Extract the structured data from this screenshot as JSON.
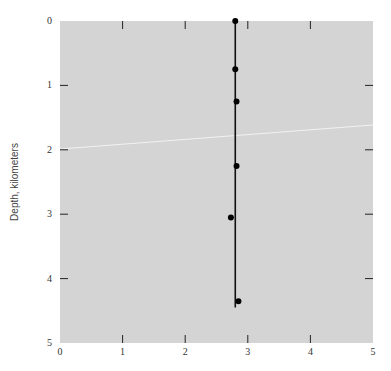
{
  "chart_data": {
    "type": "scatter",
    "title": "",
    "xlabel": "",
    "ylabel": "Depth, kilometers",
    "xlim": [
      0,
      5
    ],
    "ylim": [
      0,
      5
    ],
    "y_inverted": true,
    "grid": false,
    "legend": null,
    "x_ticks": [
      "0",
      "1",
      "2",
      "3",
      "4",
      "5"
    ],
    "y_ticks": [
      "0",
      "1",
      "2",
      "3",
      "4",
      "5"
    ],
    "series": [
      {
        "name": "measurements",
        "points": [
          {
            "x": 2.8,
            "y": 0.0
          },
          {
            "x": 2.8,
            "y": 0.75
          },
          {
            "x": 2.82,
            "y": 1.25
          },
          {
            "x": 2.82,
            "y": 2.25
          },
          {
            "x": 2.73,
            "y": 3.05
          },
          {
            "x": 2.85,
            "y": 4.35
          }
        ]
      }
    ],
    "annotations": [
      {
        "type": "vertical_line",
        "x": 2.8,
        "y_from": 0.0,
        "y_to": 4.45
      }
    ],
    "colors": {
      "plot_background": "#d4d4d4",
      "points": "#000000",
      "line": "#111111"
    }
  }
}
